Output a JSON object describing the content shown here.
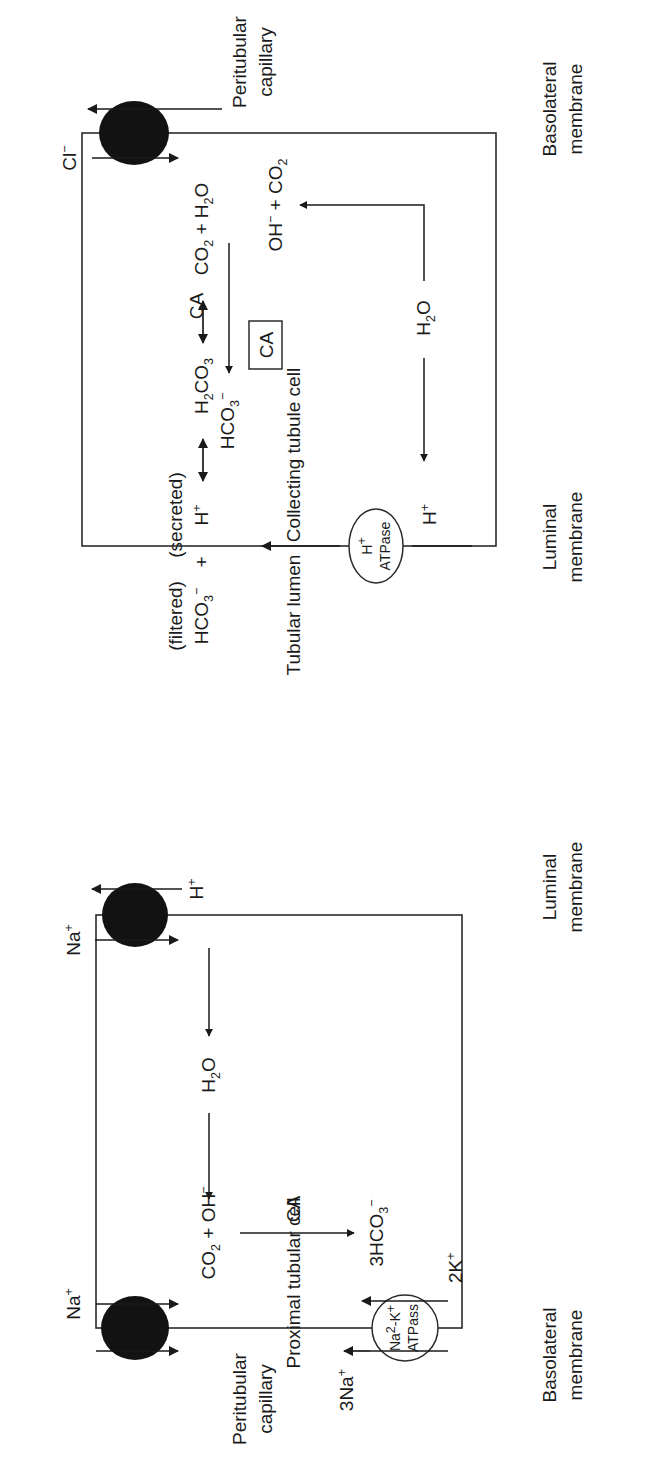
{
  "figure": {
    "orientation_deg": -90,
    "line_color": "#2b2b2b",
    "text_color": "#1a1a1a",
    "transporter_fill": "#121212",
    "background": "#ffffff"
  },
  "compartments": {
    "peritubular_capillary_left": "Peritubular\ncapillary",
    "peritubular_capillary_right": "Peritubular\ncapillary",
    "proximal_cell": "Proximal tubular cell",
    "collecting_cell": "Collecting tubule cell",
    "lumen": "Tubular lumen"
  },
  "compartment_lines": {
    "peritubular_left_l1": "Peritubular",
    "peritubular_left_l2": "capillary",
    "peritubular_right_l1": "Peritubular",
    "peritubular_right_l2": "capillary",
    "proximal_cell": "Proximal tubular cell",
    "collecting_cell": "Collecting tubule cell",
    "lumen": "Tubular lumen"
  },
  "membrane_labels": {
    "proximal_basolateral_l1": "Basolateral",
    "proximal_basolateral_l2": "membrane",
    "proximal_luminal_l1": "Luminal",
    "proximal_luminal_l2": "membrane",
    "collecting_luminal_l1": "Luminal",
    "collecting_luminal_l2": "membrane",
    "collecting_basolateral_l1": "Basolateral",
    "collecting_basolateral_l2": "membrane"
  },
  "proximal_cell": {
    "pump_line1": "Na",
    "pump_line1_sup": "2",
    "pump_line1_mid": "-K",
    "pump_line1_sup2": "+",
    "pump_line2": "ATPass",
    "na_in": "3Na",
    "na_in_sup": "+",
    "k_out": "2K",
    "k_out_sup": "+",
    "na_exchange": "Na",
    "na_exchange_sup": "+",
    "h_secreted": "H",
    "h_secreted_sup": "+",
    "water": "H",
    "water_sub": "2",
    "water_end": "O",
    "co2_oh": "CO",
    "co2_oh_sub": "2",
    "co2_oh_mid": " + OH",
    "co2_oh_sup": "−",
    "ca_enzyme": "CA",
    "hco3_out": "3HCO",
    "hco3_out_sub": "3",
    "hco3_out_sup": "−",
    "na_out": "Na",
    "na_out_sup": "+"
  },
  "lumen": {
    "filtered_note": "(filtered)",
    "secreted_note": "(secreted)",
    "hco3": "HCO",
    "hco3_sub": "3",
    "hco3_sup": "−",
    "plus": "+",
    "h_ion": "H",
    "h_ion_sup": "+",
    "h2co3": "H",
    "h2co3_sub1": "2",
    "h2co3_mid": "CO",
    "h2co3_sub2": "3",
    "co2_h2o_a": "CO",
    "co2_h2o_sub1": "2",
    "co2_h2o_mid": " + H",
    "co2_h2o_sub2": "2",
    "co2_h2o_end": "O",
    "ca_boxed": "CA"
  },
  "collecting_cell": {
    "pump_line1": "H",
    "pump_line1_sup": "+",
    "pump_line2": "ATPase",
    "h_secreted": "H",
    "h_secreted_sup": "+",
    "h_intracell": "H",
    "h_intracell_sup": "+",
    "water": "H",
    "water_sub": "2",
    "water_end": "O",
    "oh_co2": "OH",
    "oh_co2_sup": "−",
    "oh_co2_mid": " + CO",
    "oh_co2_sub": "2",
    "ca_enzyme": "CA",
    "hco3": "HCO",
    "hco3_sub": "3",
    "hco3_sup": "−",
    "cl_ion": "Cl",
    "cl_ion_sup": "−"
  }
}
